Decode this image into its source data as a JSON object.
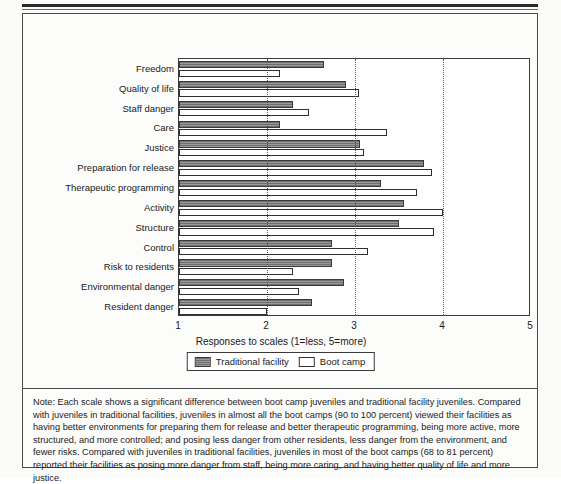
{
  "chart_data": {
    "type": "bar",
    "orientation": "horizontal",
    "title": "",
    "xlabel": "Responses to scales (1=less, 5=more)",
    "ylabel": "",
    "xlim": [
      1,
      5
    ],
    "xticks": [
      1,
      2,
      3,
      4,
      5
    ],
    "xticklabels": [
      "1",
      "2",
      "3",
      "4",
      "5"
    ],
    "gridlines": [
      2,
      3,
      4
    ],
    "grid": true,
    "legend_position": "bottom-center",
    "categories": [
      "Freedom",
      "Quality of life",
      "Staff danger",
      "Care",
      "Justice",
      "Preparation for release",
      "Therapeutic programming",
      "Activity",
      "Structure",
      "Control",
      "Risk to residents",
      "Environmental danger",
      "Resident danger"
    ],
    "series": [
      {
        "name": "Traditional facility",
        "style": "dark-hatched",
        "color": "#8a8a8a",
        "values": [
          2.65,
          2.9,
          2.3,
          2.15,
          3.06,
          3.78,
          3.3,
          3.56,
          3.5,
          2.74,
          2.74,
          2.87,
          2.51
        ]
      },
      {
        "name": "Boot camp",
        "style": "white",
        "color": "#ffffff",
        "values": [
          2.15,
          3.05,
          2.48,
          3.36,
          3.1,
          3.88,
          3.7,
          4.0,
          3.9,
          3.15,
          2.3,
          2.36,
          2.0
        ]
      }
    ]
  },
  "legend": {
    "items": [
      {
        "label": "Traditional facility"
      },
      {
        "label": "Boot camp"
      }
    ]
  },
  "note": {
    "text": "Note: Each scale shows a significant difference between boot camp juveniles and traditional facility juveniles. Compared with juveniles in traditional facilities, juveniles in almost all the boot camps (90 to 100 percent) viewed their facilities as having better environments for preparing them for release and better therapeutic programming, being more active, more structured, and more controlled; and posing less danger from other residents, less danger from the environment, and fewer risks. Compared with juveniles in traditional facilities, juveniles in most of the boot camps (68 to 81 percent) reported their facilities as posing more danger from staff, being more caring, and having better quality of life and more justice."
  }
}
